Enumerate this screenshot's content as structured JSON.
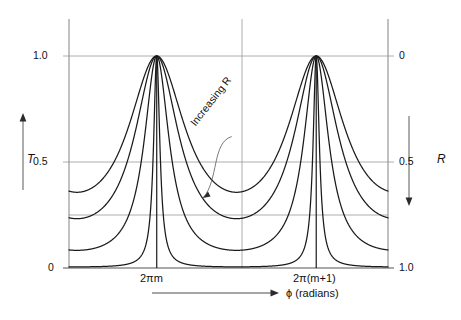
{
  "figure": {
    "title": "",
    "background": "#ffffff",
    "curve_color": "#1a1a1a",
    "grid_color": "#9a9a9a",
    "frame_color": "#8e8e8e"
  },
  "labels": {
    "y_left_axis": "T",
    "y_right_axis": "R",
    "x_axis": "ϕ (radians)",
    "annotation": "Increasing R",
    "y_left_ticks": [
      "1.0",
      "0.5",
      "0"
    ],
    "y_right_ticks": [
      "0",
      "0.5",
      "1.0"
    ],
    "x_ticks": [
      "2πm",
      "2π(m+1)"
    ]
  },
  "chart_data": {
    "type": "line",
    "title": "",
    "xlabel": "ϕ (radians)",
    "ylabel": "T",
    "y2label": "R",
    "xlim": [
      -0.55,
      1.45
    ],
    "ylim": [
      0,
      1
    ],
    "y2lim": [
      1,
      0
    ],
    "grid": true,
    "legend": "none",
    "x_tick_values": [
      0,
      1
    ],
    "x_tick_labels": [
      "2πm",
      "2π(m+1)"
    ],
    "y_tick_values": [
      0,
      0.25,
      0.5,
      1.0
    ],
    "y_tick_labels_shown": [
      "0",
      "0.5",
      "1.0"
    ],
    "y2_tick_values": [
      0,
      0.5,
      1.0
    ],
    "y2_tick_labels_shown": [
      "0",
      "0.5",
      "1.0"
    ],
    "annotations": [
      {
        "text": "Increasing R",
        "rotation_deg": -52,
        "arrow_from_x": 0.47,
        "arrow_from_y": 0.62,
        "arrow_to_x": 0.29,
        "arrow_to_y": 0.33
      }
    ],
    "series": [
      {
        "name": "R low (finesse coefficient F = 1.8)",
        "F": 1.8,
        "peak_value": 1.0,
        "min_value": 0.59,
        "value_at_left_edge": 0.59
      },
      {
        "name": "R medium-low (finesse coefficient F = 3.3)",
        "F": 3.3,
        "peak_value": 1.0,
        "min_value": 0.43,
        "value_at_left_edge": 0.46
      },
      {
        "name": "R medium-high (finesse coefficient F = 11)",
        "F": 11,
        "peak_value": 1.0,
        "min_value": 0.26,
        "value_at_left_edge": 0.27
      },
      {
        "name": "R high (finesse coefficient F = 180)",
        "F": 180,
        "peak_value": 1.0,
        "min_value": 0.01,
        "value_at_left_edge": 0.013
      }
    ],
    "peak_positions_x": [
      0,
      1
    ],
    "minimum_position_x": 0.5
  },
  "geometry": {
    "plot_left_px": 69,
    "plot_right_px": 388,
    "plot_top_px": 19,
    "plot_bottom_px": 268,
    "y_one_px": 56,
    "y_half_px": 162,
    "y_quarter_px": 215,
    "y_zero_px": 268,
    "peak1_px": 159,
    "peak2_px": 325,
    "mid_px": 242
  }
}
